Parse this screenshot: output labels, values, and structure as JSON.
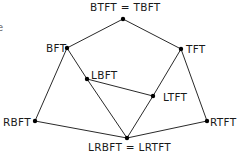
{
  "diagram": {
    "type": "lattice",
    "left_fragment": "e",
    "nodes": [
      {
        "id": "top",
        "label": "BTFT = TBFT",
        "x": 123,
        "y": 19,
        "lx": 90,
        "ly": 11,
        "anchor": "start"
      },
      {
        "id": "bft",
        "label": "BFT",
        "x": 67,
        "y": 48,
        "lx": 46,
        "ly": 52,
        "anchor": "start"
      },
      {
        "id": "tft",
        "label": "TFT",
        "x": 181,
        "y": 49,
        "lx": 186,
        "ly": 53,
        "anchor": "start"
      },
      {
        "id": "lbft",
        "label": "LBFT",
        "x": 87,
        "y": 79,
        "lx": 91,
        "ly": 79,
        "anchor": "start"
      },
      {
        "id": "ltft",
        "label": "LTFT",
        "x": 153,
        "y": 96,
        "lx": 163,
        "ly": 101,
        "anchor": "start"
      },
      {
        "id": "rbft",
        "label": "RBFT",
        "x": 35,
        "y": 121,
        "lx": 3,
        "ly": 126,
        "anchor": "start"
      },
      {
        "id": "rtft",
        "label": "RTFT",
        "x": 207,
        "y": 121,
        "lx": 210,
        "ly": 126,
        "anchor": "start"
      },
      {
        "id": "bottom",
        "label": "LRBFT = LRTFT",
        "x": 127,
        "y": 138,
        "lx": 88,
        "ly": 151,
        "anchor": "start"
      }
    ],
    "edges": [
      [
        "top",
        "bft"
      ],
      [
        "top",
        "tft"
      ],
      [
        "bft",
        "rbft"
      ],
      [
        "bft",
        "lbft"
      ],
      [
        "lbft",
        "bottom"
      ],
      [
        "lbft",
        "ltft"
      ],
      [
        "tft",
        "ltft"
      ],
      [
        "tft",
        "rtft"
      ],
      [
        "ltft",
        "bottom"
      ],
      [
        "rbft",
        "bottom"
      ],
      [
        "rtft",
        "bottom"
      ]
    ]
  }
}
